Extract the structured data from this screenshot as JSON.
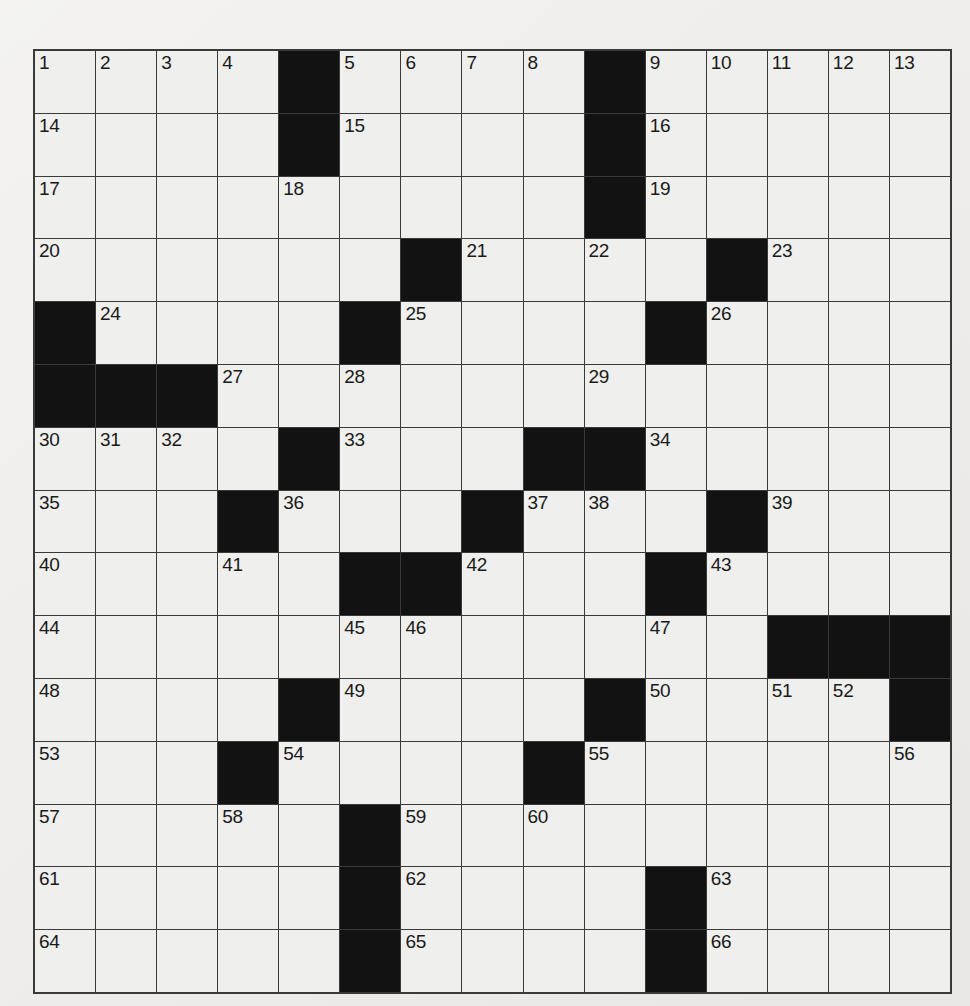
{
  "page": {
    "background_color": "#efeeec"
  },
  "grid": {
    "rows": 15,
    "columns": 15,
    "cell_background_color": "#efefed",
    "block_color": "#121212",
    "line_color": "#3a3a3a",
    "total_clue_numbers": 66,
    "filled_letters": "",
    "cells": [
      [
        {
          "number": "1",
          "black": false
        },
        {
          "number": "2",
          "black": false
        },
        {
          "number": "3",
          "black": false
        },
        {
          "number": "4",
          "black": false
        },
        {
          "number": "",
          "black": true
        },
        {
          "number": "5",
          "black": false
        },
        {
          "number": "6",
          "black": false
        },
        {
          "number": "7",
          "black": false
        },
        {
          "number": "8",
          "black": false
        },
        {
          "number": "",
          "black": true
        },
        {
          "number": "9",
          "black": false
        },
        {
          "number": "10",
          "black": false
        },
        {
          "number": "11",
          "black": false
        },
        {
          "number": "12",
          "black": false
        },
        {
          "number": "13",
          "black": false
        }
      ],
      [
        {
          "number": "14",
          "black": false
        },
        {
          "number": "",
          "black": false
        },
        {
          "number": "",
          "black": false
        },
        {
          "number": "",
          "black": false
        },
        {
          "number": "",
          "black": true
        },
        {
          "number": "15",
          "black": false
        },
        {
          "number": "",
          "black": false
        },
        {
          "number": "",
          "black": false
        },
        {
          "number": "",
          "black": false
        },
        {
          "number": "",
          "black": true
        },
        {
          "number": "16",
          "black": false
        },
        {
          "number": "",
          "black": false
        },
        {
          "number": "",
          "black": false
        },
        {
          "number": "",
          "black": false
        },
        {
          "number": "",
          "black": false
        }
      ],
      [
        {
          "number": "17",
          "black": false
        },
        {
          "number": "",
          "black": false
        },
        {
          "number": "",
          "black": false
        },
        {
          "number": "",
          "black": false
        },
        {
          "number": "18",
          "black": false
        },
        {
          "number": "",
          "black": false
        },
        {
          "number": "",
          "black": false
        },
        {
          "number": "",
          "black": false
        },
        {
          "number": "",
          "black": false
        },
        {
          "number": "",
          "black": true
        },
        {
          "number": "19",
          "black": false
        },
        {
          "number": "",
          "black": false
        },
        {
          "number": "",
          "black": false
        },
        {
          "number": "",
          "black": false
        },
        {
          "number": "",
          "black": false
        }
      ],
      [
        {
          "number": "20",
          "black": false
        },
        {
          "number": "",
          "black": false
        },
        {
          "number": "",
          "black": false
        },
        {
          "number": "",
          "black": false
        },
        {
          "number": "",
          "black": false
        },
        {
          "number": "",
          "black": false
        },
        {
          "number": "",
          "black": true
        },
        {
          "number": "21",
          "black": false
        },
        {
          "number": "",
          "black": false
        },
        {
          "number": "22",
          "black": false
        },
        {
          "number": "",
          "black": false
        },
        {
          "number": "",
          "black": true
        },
        {
          "number": "23",
          "black": false
        },
        {
          "number": "",
          "black": false
        },
        {
          "number": "",
          "black": false
        }
      ],
      [
        {
          "number": "",
          "black": true
        },
        {
          "number": "24",
          "black": false
        },
        {
          "number": "",
          "black": false
        },
        {
          "number": "",
          "black": false
        },
        {
          "number": "",
          "black": false
        },
        {
          "number": "",
          "black": true
        },
        {
          "number": "25",
          "black": false
        },
        {
          "number": "",
          "black": false
        },
        {
          "number": "",
          "black": false
        },
        {
          "number": "",
          "black": false
        },
        {
          "number": "",
          "black": true
        },
        {
          "number": "26",
          "black": false
        },
        {
          "number": "",
          "black": false
        },
        {
          "number": "",
          "black": false
        },
        {
          "number": "",
          "black": false
        }
      ],
      [
        {
          "number": "",
          "black": true
        },
        {
          "number": "",
          "black": true
        },
        {
          "number": "",
          "black": true
        },
        {
          "number": "27",
          "black": false
        },
        {
          "number": "",
          "black": false
        },
        {
          "number": "28",
          "black": false
        },
        {
          "number": "",
          "black": false
        },
        {
          "number": "",
          "black": false
        },
        {
          "number": "",
          "black": false
        },
        {
          "number": "29",
          "black": false
        },
        {
          "number": "",
          "black": false
        },
        {
          "number": "",
          "black": false
        },
        {
          "number": "",
          "black": false
        },
        {
          "number": "",
          "black": false
        },
        {
          "number": "",
          "black": false
        }
      ],
      [
        {
          "number": "30",
          "black": false
        },
        {
          "number": "31",
          "black": false
        },
        {
          "number": "32",
          "black": false
        },
        {
          "number": "",
          "black": false
        },
        {
          "number": "",
          "black": true
        },
        {
          "number": "33",
          "black": false
        },
        {
          "number": "",
          "black": false
        },
        {
          "number": "",
          "black": false
        },
        {
          "number": "",
          "black": true
        },
        {
          "number": "",
          "black": true
        },
        {
          "number": "34",
          "black": false
        },
        {
          "number": "",
          "black": false
        },
        {
          "number": "",
          "black": false
        },
        {
          "number": "",
          "black": false
        },
        {
          "number": "",
          "black": false
        }
      ],
      [
        {
          "number": "35",
          "black": false
        },
        {
          "number": "",
          "black": false
        },
        {
          "number": "",
          "black": false
        },
        {
          "number": "",
          "black": true
        },
        {
          "number": "36",
          "black": false
        },
        {
          "number": "",
          "black": false
        },
        {
          "number": "",
          "black": false
        },
        {
          "number": "",
          "black": true
        },
        {
          "number": "37",
          "black": false
        },
        {
          "number": "38",
          "black": false
        },
        {
          "number": "",
          "black": false
        },
        {
          "number": "",
          "black": true
        },
        {
          "number": "39",
          "black": false
        },
        {
          "number": "",
          "black": false
        },
        {
          "number": "",
          "black": false
        }
      ],
      [
        {
          "number": "40",
          "black": false
        },
        {
          "number": "",
          "black": false
        },
        {
          "number": "",
          "black": false
        },
        {
          "number": "41",
          "black": false
        },
        {
          "number": "",
          "black": false
        },
        {
          "number": "",
          "black": true
        },
        {
          "number": "",
          "black": true
        },
        {
          "number": "42",
          "black": false
        },
        {
          "number": "",
          "black": false
        },
        {
          "number": "",
          "black": false
        },
        {
          "number": "",
          "black": true
        },
        {
          "number": "43",
          "black": false
        },
        {
          "number": "",
          "black": false
        },
        {
          "number": "",
          "black": false
        },
        {
          "number": "",
          "black": false
        }
      ],
      [
        {
          "number": "44",
          "black": false
        },
        {
          "number": "",
          "black": false
        },
        {
          "number": "",
          "black": false
        },
        {
          "number": "",
          "black": false
        },
        {
          "number": "",
          "black": false
        },
        {
          "number": "45",
          "black": false
        },
        {
          "number": "46",
          "black": false
        },
        {
          "number": "",
          "black": false
        },
        {
          "number": "",
          "black": false
        },
        {
          "number": "",
          "black": false
        },
        {
          "number": "47",
          "black": false
        },
        {
          "number": "",
          "black": false
        },
        {
          "number": "",
          "black": true
        },
        {
          "number": "",
          "black": true
        },
        {
          "number": "",
          "black": true
        }
      ],
      [
        {
          "number": "48",
          "black": false
        },
        {
          "number": "",
          "black": false
        },
        {
          "number": "",
          "black": false
        },
        {
          "number": "",
          "black": false
        },
        {
          "number": "",
          "black": true
        },
        {
          "number": "49",
          "black": false
        },
        {
          "number": "",
          "black": false
        },
        {
          "number": "",
          "black": false
        },
        {
          "number": "",
          "black": false
        },
        {
          "number": "",
          "black": true
        },
        {
          "number": "50",
          "black": false
        },
        {
          "number": "",
          "black": false
        },
        {
          "number": "51",
          "black": false
        },
        {
          "number": "52",
          "black": false
        },
        {
          "number": "",
          "black": true
        }
      ],
      [
        {
          "number": "53",
          "black": false
        },
        {
          "number": "",
          "black": false
        },
        {
          "number": "",
          "black": false
        },
        {
          "number": "",
          "black": true
        },
        {
          "number": "54",
          "black": false
        },
        {
          "number": "",
          "black": false
        },
        {
          "number": "",
          "black": false
        },
        {
          "number": "",
          "black": false
        },
        {
          "number": "",
          "black": true
        },
        {
          "number": "55",
          "black": false
        },
        {
          "number": "",
          "black": false
        },
        {
          "number": "",
          "black": false
        },
        {
          "number": "",
          "black": false
        },
        {
          "number": "",
          "black": false
        },
        {
          "number": "56",
          "black": false
        }
      ],
      [
        {
          "number": "57",
          "black": false
        },
        {
          "number": "",
          "black": false
        },
        {
          "number": "",
          "black": false
        },
        {
          "number": "58",
          "black": false
        },
        {
          "number": "",
          "black": false
        },
        {
          "number": "",
          "black": true
        },
        {
          "number": "59",
          "black": false
        },
        {
          "number": "",
          "black": false
        },
        {
          "number": "60",
          "black": false
        },
        {
          "number": "",
          "black": false
        },
        {
          "number": "",
          "black": false
        },
        {
          "number": "",
          "black": false
        },
        {
          "number": "",
          "black": false
        },
        {
          "number": "",
          "black": false
        },
        {
          "number": "",
          "black": false
        }
      ],
      [
        {
          "number": "61",
          "black": false
        },
        {
          "number": "",
          "black": false
        },
        {
          "number": "",
          "black": false
        },
        {
          "number": "",
          "black": false
        },
        {
          "number": "",
          "black": false
        },
        {
          "number": "",
          "black": true
        },
        {
          "number": "62",
          "black": false
        },
        {
          "number": "",
          "black": false
        },
        {
          "number": "",
          "black": false
        },
        {
          "number": "",
          "black": false
        },
        {
          "number": "",
          "black": true
        },
        {
          "number": "63",
          "black": false
        },
        {
          "number": "",
          "black": false
        },
        {
          "number": "",
          "black": false
        },
        {
          "number": "",
          "black": false
        }
      ],
      [
        {
          "number": "64",
          "black": false
        },
        {
          "number": "",
          "black": false
        },
        {
          "number": "",
          "black": false
        },
        {
          "number": "",
          "black": false
        },
        {
          "number": "",
          "black": false
        },
        {
          "number": "",
          "black": true
        },
        {
          "number": "65",
          "black": false
        },
        {
          "number": "",
          "black": false
        },
        {
          "number": "",
          "black": false
        },
        {
          "number": "",
          "black": false
        },
        {
          "number": "",
          "black": true
        },
        {
          "number": "66",
          "black": false
        },
        {
          "number": "",
          "black": false
        },
        {
          "number": "",
          "black": false
        },
        {
          "number": "",
          "black": false
        }
      ]
    ]
  }
}
